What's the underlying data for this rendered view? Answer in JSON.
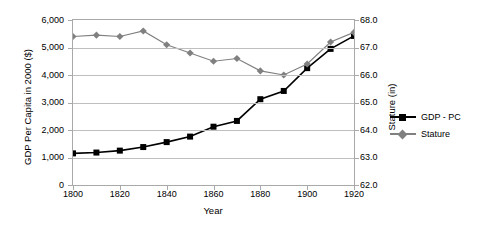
{
  "chart_data": {
    "type": "line",
    "title": "",
    "xlabel": "Year",
    "ylabel": "GDP Per Capita in 2000 ($)",
    "y2label": "Stature (in)",
    "grid": true,
    "legend_position": "right",
    "xlim": [
      1800,
      1920
    ],
    "ylim": [
      0,
      6000
    ],
    "y2lim": [
      62.0,
      68.0
    ],
    "x": [
      1800,
      1810,
      1820,
      1830,
      1840,
      1850,
      1860,
      1870,
      1880,
      1890,
      1900,
      1910,
      1920
    ],
    "xticks": [
      "1800",
      "1820",
      "1840",
      "1860",
      "1880",
      "1900",
      "1920"
    ],
    "xtick_values": [
      1800,
      1820,
      1840,
      1860,
      1880,
      1900,
      1920
    ],
    "yticks": [
      "0",
      "1,000",
      "2,000",
      "3,000",
      "4,000",
      "5,000",
      "6,000"
    ],
    "ytick_values": [
      0,
      1000,
      2000,
      3000,
      4000,
      5000,
      6000
    ],
    "y2ticks": [
      "62.0",
      "63.0",
      "64.0",
      "65.0",
      "66.0",
      "67.0",
      "68.0"
    ],
    "y2tick_values": [
      62.0,
      63.0,
      64.0,
      65.0,
      66.0,
      67.0,
      68.0
    ],
    "series": [
      {
        "name": "GDP - PC",
        "axis": "left",
        "color": "#000000",
        "marker": "square",
        "values": [
          1150,
          1180,
          1250,
          1380,
          1560,
          1760,
          2120,
          2330,
          3120,
          3420,
          4250,
          4950,
          5420
        ]
      },
      {
        "name": "Stature",
        "axis": "right",
        "color": "#808080",
        "marker": "diamond",
        "values": [
          67.4,
          67.45,
          67.4,
          67.6,
          67.1,
          66.8,
          66.5,
          66.6,
          66.15,
          66.0,
          66.4,
          67.2,
          67.55
        ]
      }
    ]
  },
  "legend": {
    "items": [
      {
        "label": "GDP - PC"
      },
      {
        "label": "Stature"
      }
    ]
  }
}
